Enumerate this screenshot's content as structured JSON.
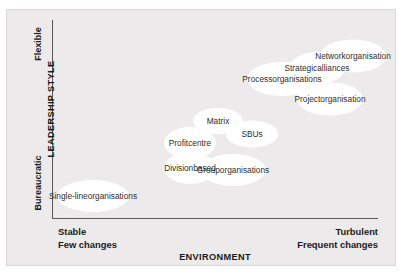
{
  "figure": {
    "type": "scatter-bubble-matrix",
    "background_color": "#eceaea",
    "bubble_color": "#ffffff",
    "axis_color": "#58585a"
  },
  "axes": {
    "y": {
      "title": "LEADERSHIP STYLE",
      "high_label": "Flexible",
      "low_label": "Bureaucratic"
    },
    "x": {
      "title": "ENVIRONMENT",
      "low_label_line1": "Stable",
      "low_label_line2": "Few changes",
      "high_label_line1": "Turbulent",
      "high_label_line2": "Frequent changes"
    }
  },
  "chart_data": {
    "type": "scatter",
    "title": "",
    "xlabel": "ENVIRONMENT",
    "ylabel": "LEADERSHIP STYLE",
    "xlim": [
      0,
      100
    ],
    "ylim": [
      0,
      100
    ],
    "grid": false,
    "legend": "none",
    "x_axis_ticks": [
      "Stable / Few changes",
      "Turbulent / Frequent changes"
    ],
    "y_axis_ticks": [
      "Bureaucratic",
      "Flexible"
    ],
    "points": [
      {
        "label": "Single-line organisations",
        "lines": [
          "Single-line",
          "organisations"
        ],
        "x": 9,
        "y": 17,
        "px": 93,
        "py": 196,
        "w": 72,
        "h": 32
      },
      {
        "label": "Division based",
        "lines": [
          "Division",
          "based"
        ],
        "x": 38,
        "y": 31,
        "px": 190,
        "py": 168,
        "w": 52,
        "h": 32
      },
      {
        "label": "Profit centre",
        "lines": [
          "Profit",
          "centre"
        ],
        "x": 38,
        "y": 42,
        "px": 190,
        "py": 143,
        "w": 52,
        "h": 32
      },
      {
        "label": "Matrix",
        "lines": [
          "Matrix"
        ],
        "x": 53,
        "y": 52,
        "px": 218,
        "py": 121,
        "w": 50,
        "h": 26
      },
      {
        "label": "SBUs",
        "lines": [
          "SBUs"
        ],
        "x": 62,
        "y": 44,
        "px": 252,
        "py": 134,
        "w": 52,
        "h": 27
      },
      {
        "label": "Group organisations",
        "lines": [
          "Group",
          "organisations"
        ],
        "x": 55,
        "y": 30,
        "px": 233,
        "py": 170,
        "w": 66,
        "h": 32
      },
      {
        "label": "Process organisations",
        "lines": [
          "Process",
          "organisations"
        ],
        "x": 70,
        "y": 68,
        "px": 282,
        "py": 79,
        "w": 70,
        "h": 34
      },
      {
        "label": "Strategic alliances",
        "lines": [
          "Strategic",
          "alliances"
        ],
        "x": 80,
        "y": 74,
        "px": 317,
        "py": 68,
        "w": 56,
        "h": 32
      },
      {
        "label": "Network organisation",
        "lines": [
          "Network",
          "organisation"
        ],
        "x": 91,
        "y": 83,
        "px": 353,
        "py": 56,
        "w": 66,
        "h": 33
      },
      {
        "label": "Project organisation",
        "lines": [
          "Project",
          "organisation"
        ],
        "x": 83,
        "y": 62,
        "px": 330,
        "py": 99,
        "w": 66,
        "h": 33
      }
    ]
  }
}
